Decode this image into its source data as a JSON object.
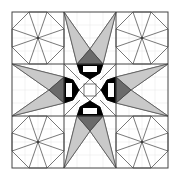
{
  "diagram": {
    "title": "Quilt block pattern",
    "grid": {
      "rows": 3,
      "cols": 3
    },
    "colors": {
      "background": "#ffffff",
      "light_gray": "#c9c9c9",
      "dark_gray": "#6a6a6a",
      "black": "#000000",
      "line": "#555555"
    },
    "cells": [
      {
        "position": "top-left",
        "pattern": "octagon-star"
      },
      {
        "position": "top-center",
        "pattern": "converging-wedges"
      },
      {
        "position": "top-right",
        "pattern": "octagon-star"
      },
      {
        "position": "middle-left",
        "pattern": "converging-wedges"
      },
      {
        "position": "center",
        "pattern": "diamond-with-square"
      },
      {
        "position": "middle-right",
        "pattern": "converging-wedges"
      },
      {
        "position": "bottom-left",
        "pattern": "octagon-star"
      },
      {
        "position": "bottom-center",
        "pattern": "converging-wedges"
      },
      {
        "position": "bottom-right",
        "pattern": "octagon-star"
      }
    ]
  }
}
